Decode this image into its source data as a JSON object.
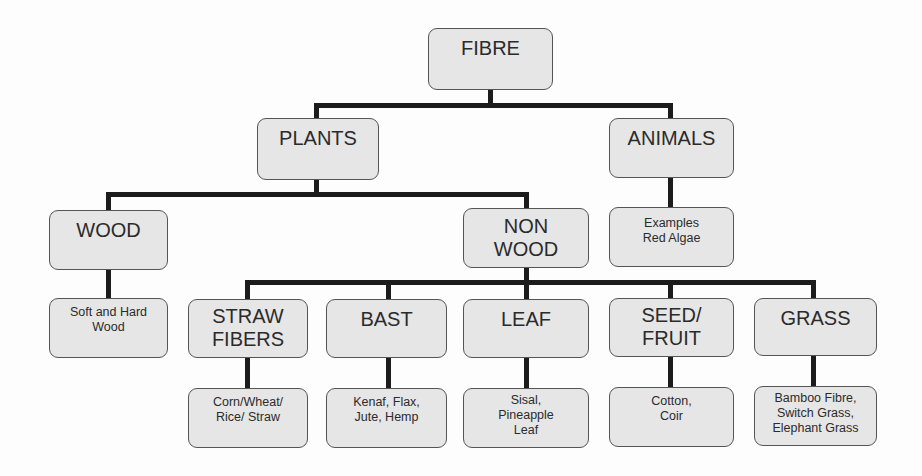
{
  "diagram": {
    "root": {
      "label": "FIBRE"
    },
    "level1": [
      {
        "label": "PLANTS"
      },
      {
        "label": "ANIMALS"
      }
    ],
    "level2": [
      {
        "label": "WOOD"
      },
      {
        "line1": "NON",
        "line2": "WOOD"
      },
      {
        "line1": "Examples",
        "line2": "Red Algae"
      }
    ],
    "level3": [
      {
        "line1": "Soft and Hard",
        "line2": "Wood"
      },
      {
        "line1": "STRAW",
        "line2": "FIBERS"
      },
      {
        "line1": "BAST"
      },
      {
        "line1": "LEAF"
      },
      {
        "line1": "SEED/",
        "line2": "FRUIT"
      },
      {
        "line1": "GRASS"
      }
    ],
    "level4": [
      {
        "line1": "Corn/Wheat/",
        "line2": "Rice/ Straw"
      },
      {
        "line1": "Kenaf, Flax,",
        "line2": "Jute, Hemp"
      },
      {
        "line1": "Sisal,",
        "line2": "Pineapple",
        "line3": "Leaf"
      },
      {
        "line1": "Cotton,",
        "line2": "Coir"
      },
      {
        "line1": "Bamboo Fibre,",
        "line2": "Switch Grass,",
        "line3": "Elephant Grass"
      }
    ]
  }
}
